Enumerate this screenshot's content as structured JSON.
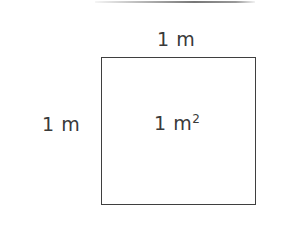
{
  "figure": {
    "kind": "geometry-diagram",
    "top_rule_color": "#6f6f6f",
    "shape": {
      "name": "square",
      "stroke_color": "#3f3f3f",
      "fill_color": "#ffffff",
      "side_px": {
        "width": 155,
        "height": 148
      }
    },
    "labels": {
      "top_side": "1 m",
      "left_side": "1 m",
      "area_value": "1 m",
      "area_exponent": "2"
    }
  }
}
